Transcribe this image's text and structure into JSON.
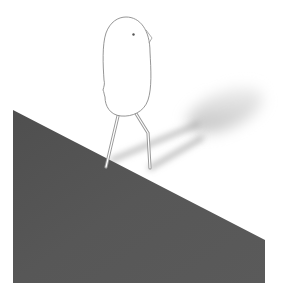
{
  "scene": {
    "description": "Illustration of a pale bird-like figure on two thin legs walking down a dark gray slope, casting a long soft shadow toward the upper right",
    "colors": {
      "background": "#ffffff",
      "slope": "#555555",
      "slope_dark": "#4a4a4a",
      "figure_fill": "#ffffff",
      "figure_outline": "#8a8a8a",
      "legs": "#9a9a9a",
      "shadow": "#b5b5b5",
      "eye": "#555555"
    },
    "elements": {
      "slope": "dark-slope",
      "figure": "bird-figure",
      "shadow": "cast-shadow"
    }
  }
}
